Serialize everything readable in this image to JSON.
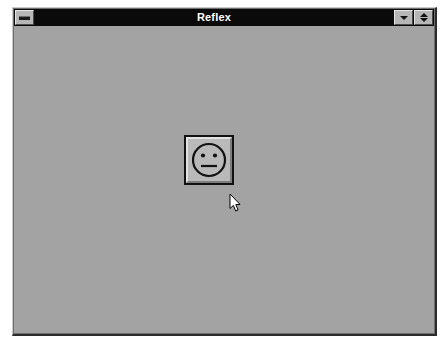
{
  "window": {
    "title": "Reflex",
    "system_menu_icon": "system-menu-icon",
    "minimize_icon": "minimize-triangle-down-icon",
    "restore_icon": "restore-triangles-icon",
    "colors": {
      "titlebar_background": "#0a0a0a",
      "titlebar_text": "#ffffff",
      "client_background": "#a3a3a3",
      "window_border": "#2b2b2b",
      "button_face": "#b9b9b9",
      "button_highlight": "#e2e2e2",
      "button_shadow": "#7d7d7d",
      "ink": "#111111",
      "desktop_background": "#ffffff"
    }
  },
  "main": {
    "face_button": {
      "name": "neutral-face-button",
      "icon": "neutral-face-icon",
      "expression": "neutral",
      "features": {
        "head": "circle-outline",
        "eyes": 2,
        "mouth": "straight-horizontal-line"
      },
      "label": ""
    }
  },
  "pointer": {
    "icon": "arrow-cursor-icon",
    "x": 231,
    "y": 196
  }
}
